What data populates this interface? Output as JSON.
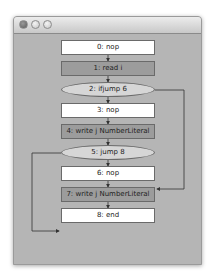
{
  "window": {
    "title_buttons": [
      "close",
      "minimize",
      "maximize"
    ],
    "background_color": "#b5b5b5"
  },
  "flowchart": {
    "nodes": [
      {
        "id": 0,
        "label": "0: nop",
        "shape": "rect",
        "fill": "#ffffff"
      },
      {
        "id": 1,
        "label": "1: read i",
        "shape": "rect",
        "fill": "#9c9c9c"
      },
      {
        "id": 2,
        "label": "2: ifjump 6",
        "shape": "ellipse",
        "fill": "#d6d6d6"
      },
      {
        "id": 3,
        "label": "3: nop",
        "shape": "rect",
        "fill": "#ffffff"
      },
      {
        "id": 4,
        "label": "4: write j NumberLiteral",
        "shape": "rect",
        "fill": "#9c9c9c"
      },
      {
        "id": 5,
        "label": "5: jump 8",
        "shape": "ellipse",
        "fill": "#d6d6d6"
      },
      {
        "id": 6,
        "label": "6: nop",
        "shape": "rect",
        "fill": "#ffffff"
      },
      {
        "id": 7,
        "label": "7: write j NumberLiteral",
        "shape": "rect",
        "fill": "#9c9c9c"
      },
      {
        "id": 8,
        "label": "8: end",
        "shape": "rect",
        "fill": "#ffffff"
      }
    ],
    "edges": [
      {
        "from": 0,
        "to": 1
      },
      {
        "from": 1,
        "to": 2
      },
      {
        "from": 2,
        "to": 3
      },
      {
        "from": 2,
        "to": 6,
        "route": "right"
      },
      {
        "from": 3,
        "to": 4
      },
      {
        "from": 4,
        "to": 5
      },
      {
        "from": 5,
        "to": 6
      },
      {
        "from": 5,
        "to": 8,
        "route": "left"
      },
      {
        "from": 6,
        "to": 7
      },
      {
        "from": 7,
        "to": 8
      }
    ]
  }
}
